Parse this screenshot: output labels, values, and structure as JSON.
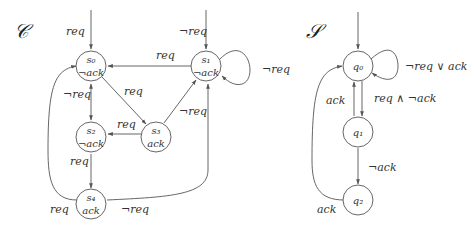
{
  "diagrams": [
    {
      "title": "𝒞",
      "nodes": [
        {
          "id": "s0",
          "name": "s₀",
          "label": "¬ack"
        },
        {
          "id": "s1",
          "name": "s₁",
          "label": "¬ack"
        },
        {
          "id": "s2",
          "name": "s₂",
          "label": "¬ack"
        },
        {
          "id": "s3",
          "name": "s₃",
          "label": "ack"
        },
        {
          "id": "s4",
          "name": "s₄",
          "label": "ack"
        }
      ],
      "edges": [
        {
          "from": "init",
          "to": "s0",
          "label": "req"
        },
        {
          "from": "init",
          "to": "s1",
          "label": "¬req"
        },
        {
          "from": "s1",
          "to": "s0",
          "label": "req"
        },
        {
          "from": "s1",
          "to": "s1",
          "label": "¬req"
        },
        {
          "from": "s0",
          "to": "s3",
          "label": "req"
        },
        {
          "from": "s3",
          "to": "s1",
          "label": "¬req"
        },
        {
          "from": "s0",
          "to": "s2",
          "label": "¬req"
        },
        {
          "from": "s3",
          "to": "s2",
          "label": "req"
        },
        {
          "from": "s2",
          "to": "s4",
          "label": "req"
        },
        {
          "from": "s4",
          "to": "s0",
          "label": "req"
        },
        {
          "from": "s4",
          "to": "s1",
          "label": "¬req"
        }
      ]
    },
    {
      "title": "𝒮",
      "nodes": [
        {
          "id": "q0",
          "name": "q₀",
          "label": ""
        },
        {
          "id": "q1",
          "name": "q₁",
          "label": ""
        },
        {
          "id": "q2",
          "name": "q₂",
          "label": ""
        }
      ],
      "edges": [
        {
          "from": "init",
          "to": "q0",
          "label": ""
        },
        {
          "from": "q0",
          "to": "q0",
          "label": "¬req ∨ ack"
        },
        {
          "from": "q0",
          "to": "q1",
          "label": "req ∧ ¬ack"
        },
        {
          "from": "q1",
          "to": "q0",
          "label": "ack"
        },
        {
          "from": "q1",
          "to": "q2",
          "label": "¬ack"
        },
        {
          "from": "q2",
          "to": "q0",
          "label": "ack"
        }
      ]
    }
  ]
}
